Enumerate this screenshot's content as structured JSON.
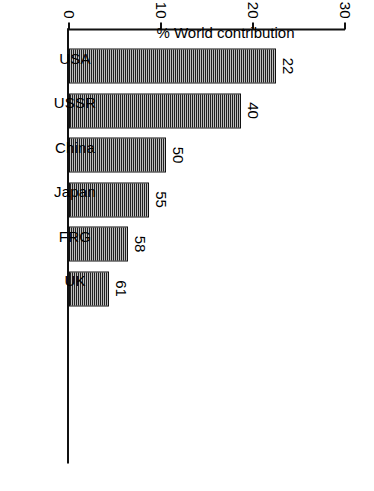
{
  "chart_data": {
    "type": "bar",
    "title": "",
    "subtitle": "",
    "categories": [
      "USA",
      "USSR",
      "China",
      "Japan",
      "FRG",
      "UK"
    ],
    "values": [
      22.5,
      18.7,
      10.5,
      8.7,
      6.4,
      4.3
    ],
    "data_labels": [
      "22",
      "40",
      "50",
      "55",
      "58",
      "61"
    ],
    "data_label_meaning": "Cumulative %",
    "xlabel": "",
    "ylabel": "% World contribution",
    "ylim": [
      0,
      30
    ],
    "ytick_labels": [
      "0",
      "10",
      "20",
      "30"
    ],
    "ytick_values": [
      0,
      10,
      20,
      30
    ],
    "grid": false,
    "legend": "none",
    "orientation": "vertical-bars-printed-sideways",
    "series": [
      {
        "name": "% World contribution",
        "values": [
          22.5,
          18.7,
          10.5,
          8.7,
          6.4,
          4.3
        ]
      },
      {
        "name": "Cumulative %",
        "values": [
          22,
          40,
          50,
          55,
          58,
          61
        ]
      }
    ]
  },
  "axes": {
    "value_axis_title": "% World contribution",
    "ticks": [
      {
        "label": "0",
        "value": 0
      },
      {
        "label": "10",
        "value": 10
      },
      {
        "label": "20",
        "value": 20
      },
      {
        "label": "30",
        "value": 30
      }
    ]
  },
  "annotations": {
    "cumulative_legend_line1": "Cumulative",
    "cumulative_legend_line2": "%"
  },
  "bars": [
    {
      "category": "USA",
      "value": 22.5,
      "cumulative": "22"
    },
    {
      "category": "USSR",
      "value": 18.7,
      "cumulative": "40"
    },
    {
      "category": "China",
      "value": 10.5,
      "cumulative": "50"
    },
    {
      "category": "Japan",
      "value": 8.7,
      "cumulative": "55"
    },
    {
      "category": "FRG",
      "value": 6.4,
      "cumulative": "58"
    },
    {
      "category": "UK",
      "value": 4.3,
      "cumulative": "61"
    }
  ],
  "style": {
    "ink": "#111111",
    "paper": "#ffffff"
  }
}
